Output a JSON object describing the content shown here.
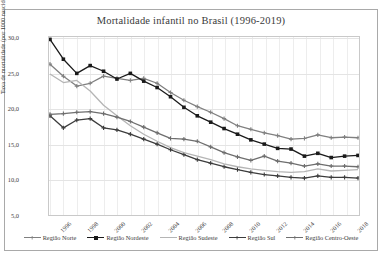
{
  "chart_data": {
    "type": "line",
    "title": "Mortalidade infantil no Brasil (1996-2019)",
    "xlabel": "",
    "ylabel": "Taxa de mortalidade (por 1000 nascidos vivos)",
    "ylim": [
      5.0,
      30.0
    ],
    "yticks": [
      "5,0",
      "10,0",
      "15,0",
      "20,0",
      "25,0",
      "30,0"
    ],
    "ytick_values": [
      5.0,
      10.0,
      15.0,
      20.0,
      25.0,
      30.0
    ],
    "grid": true,
    "legend_position": "bottom",
    "x": [
      1996,
      1997,
      1998,
      1999,
      2000,
      2001,
      2002,
      2003,
      2004,
      2005,
      2006,
      2007,
      2008,
      2009,
      2010,
      2011,
      2012,
      2013,
      2014,
      2015,
      2016,
      2017,
      2018,
      2019
    ],
    "xticks": [
      "1996",
      "1998",
      "2000",
      "2002",
      "2004",
      "2006",
      "2008",
      "2010",
      "2012",
      "2014",
      "2016",
      "2018"
    ],
    "xtick_values": [
      1996,
      1998,
      2000,
      2002,
      2004,
      2006,
      2008,
      2010,
      2012,
      2014,
      2016,
      2018
    ],
    "series": [
      {
        "name": "Região Norte",
        "color": "#808080",
        "marker": "cross",
        "values": [
          26.3,
          24.6,
          23.2,
          23.6,
          24.6,
          24.3,
          24.0,
          24.3,
          23.6,
          22.3,
          21.2,
          20.3,
          19.5,
          18.6,
          17.6,
          17.1,
          16.6,
          16.2,
          15.7,
          15.8,
          16.3,
          15.9,
          16.0,
          15.9
        ]
      },
      {
        "name": "Região Nordeste",
        "color": "#1a1a1a",
        "marker": "square",
        "values": [
          29.8,
          27.0,
          25.0,
          26.1,
          25.3,
          24.2,
          25.0,
          23.9,
          23.0,
          21.7,
          20.2,
          19.0,
          18.1,
          17.2,
          16.4,
          15.6,
          15.0,
          14.4,
          14.3,
          13.3,
          13.7,
          13.1,
          13.3,
          13.4
        ]
      },
      {
        "name": "Região Sudeste",
        "color": "#b5b5b5",
        "marker": "none",
        "values": [
          24.9,
          23.7,
          24.0,
          22.5,
          20.5,
          19.0,
          17.6,
          16.4,
          15.4,
          14.5,
          13.8,
          13.3,
          12.8,
          12.2,
          11.8,
          11.5,
          11.3,
          11.1,
          11.0,
          11.1,
          11.5,
          11.2,
          11.3,
          11.4
        ]
      },
      {
        "name": "Região Sul",
        "color": "#3c3c3c",
        "marker": "cross",
        "values": [
          19.0,
          17.3,
          18.4,
          18.6,
          17.3,
          17.0,
          16.4,
          15.7,
          15.0,
          14.2,
          13.5,
          12.8,
          12.3,
          11.8,
          11.4,
          11.0,
          10.7,
          10.5,
          10.3,
          10.2,
          10.5,
          10.3,
          10.3,
          10.2
        ]
      },
      {
        "name": "Região Centro-Oeste",
        "color": "#6e6e6e",
        "marker": "cross",
        "values": [
          19.2,
          19.3,
          19.5,
          19.6,
          19.3,
          18.8,
          18.2,
          17.4,
          16.6,
          15.8,
          15.7,
          15.4,
          14.6,
          13.8,
          13.2,
          12.7,
          13.3,
          12.6,
          12.3,
          11.9,
          12.2,
          11.9,
          11.9,
          11.8
        ]
      }
    ]
  }
}
